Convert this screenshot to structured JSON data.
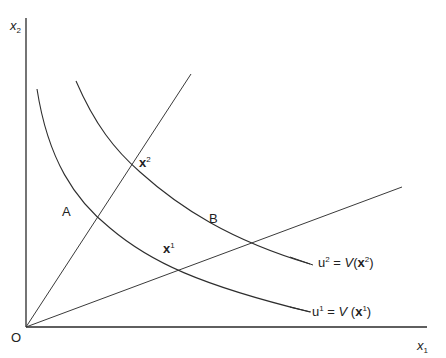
{
  "diagram": {
    "type": "indifference-curves",
    "axes": {
      "x_label": "x",
      "x_label_sub": "1",
      "y_label": "x",
      "y_label_sub": "2",
      "origin_label": "O"
    },
    "points": {
      "A": "A",
      "B": "B",
      "x1": "x",
      "x1_sup": "1",
      "x2": "x",
      "x2_sup": "2"
    },
    "curves": [
      {
        "id": "u1",
        "label_u": "u",
        "label_sup": "1",
        "label_eq": " = ",
        "label_fn": "V",
        "label_arg_open": " (",
        "label_arg": "x",
        "label_arg_sup": "1",
        "label_arg_close": ")"
      },
      {
        "id": "u2",
        "label_u": "u",
        "label_sup": "2",
        "label_eq": " = ",
        "label_fn": "V",
        "label_arg_open": "(",
        "label_arg": "x",
        "label_arg_sup": "2",
        "label_arg_close": ")"
      }
    ],
    "colors": {
      "line": "#2e2e2e",
      "background": "#ffffff"
    }
  }
}
